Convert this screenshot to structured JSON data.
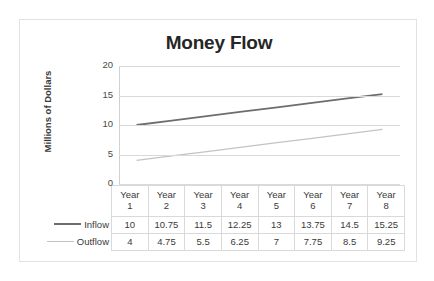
{
  "chart_data": {
    "type": "line",
    "title": "Money Flow",
    "xlabel": "",
    "ylabel": "Millions of Dollars",
    "categories": [
      "Year 1",
      "Year 2",
      "Year 3",
      "Year 4",
      "Year 5",
      "Year 6",
      "Year 7",
      "Year 8"
    ],
    "category_lines": [
      {
        "top": "Year",
        "bottom": "1"
      },
      {
        "top": "Year",
        "bottom": "2"
      },
      {
        "top": "Year",
        "bottom": "3"
      },
      {
        "top": "Year",
        "bottom": "4"
      },
      {
        "top": "Year",
        "bottom": "5"
      },
      {
        "top": "Year",
        "bottom": "6"
      },
      {
        "top": "Year",
        "bottom": "7"
      },
      {
        "top": "Year",
        "bottom": "8"
      }
    ],
    "series": [
      {
        "name": "Inflow",
        "color": "#6d6d6d",
        "values": [
          10,
          10.75,
          11.5,
          12.25,
          13,
          13.75,
          14.5,
          15.25
        ],
        "labels": [
          "10",
          "10.75",
          "11.5",
          "12.25",
          "13",
          "13.75",
          "14.5",
          "15.25"
        ]
      },
      {
        "name": "Outflow",
        "color": "#c3c3c3",
        "values": [
          4,
          4.75,
          5.5,
          6.25,
          7,
          7.75,
          8.5,
          9.25
        ],
        "labels": [
          "4",
          "4.75",
          "5.5",
          "6.25",
          "7",
          "7.75",
          "8.5",
          "9.25"
        ]
      }
    ],
    "ylim": [
      0,
      20
    ],
    "yticks": [
      20,
      15,
      10,
      5,
      0
    ],
    "ytick_labels": [
      "20",
      "15",
      "10",
      "5",
      "0"
    ],
    "grid": true,
    "legend_position": "data-table-left",
    "has_data_table": true,
    "gridline_color": "#d9d9d9",
    "border_color": "#e2e2e2",
    "text_color": "#3a3a3a",
    "title_color": "#262626"
  }
}
